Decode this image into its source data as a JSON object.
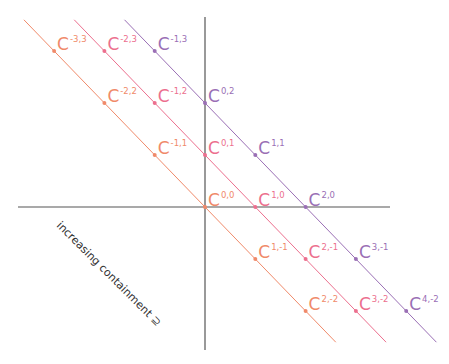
{
  "diagram": {
    "axes": {
      "origin_px": [
        205,
        207
      ],
      "horizontal": {
        "x1": 18,
        "x2": 390,
        "color": "#555555"
      },
      "vertical": {
        "y1": 17,
        "y2": 350,
        "color": "#555555"
      }
    },
    "grid_px": {
      "dx": 50.3,
      "dy": 52
    },
    "caption": {
      "text": "increasing containment ⊇",
      "x": 56,
      "y": 226,
      "rotate": 45
    },
    "lines": [
      {
        "name": "diagonal-sum-0",
        "sum": 0,
        "color": "#f08a6a"
      },
      {
        "name": "diagonal-sum-1",
        "sum": 1,
        "color": "#ec6f8e"
      },
      {
        "name": "diagonal-sum-2",
        "sum": 2,
        "color": "#9a6fb5"
      }
    ],
    "points": [
      {
        "a": -3,
        "b": 3,
        "sup": "-3,3",
        "line": 0
      },
      {
        "a": -2,
        "b": 2,
        "sup": "-2,2",
        "line": 0
      },
      {
        "a": -1,
        "b": 1,
        "sup": "-1,1",
        "line": 0
      },
      {
        "a": 0,
        "b": 0,
        "sup": "0,0",
        "line": 0
      },
      {
        "a": 1,
        "b": -1,
        "sup": "1,-1",
        "line": 0
      },
      {
        "a": 2,
        "b": -2,
        "sup": "2,-2",
        "line": 0
      },
      {
        "a": -2,
        "b": 3,
        "sup": "-2,3",
        "line": 1
      },
      {
        "a": -1,
        "b": 2,
        "sup": "-1,2",
        "line": 1
      },
      {
        "a": 0,
        "b": 1,
        "sup": "0,1",
        "line": 1
      },
      {
        "a": 1,
        "b": 0,
        "sup": "1,0",
        "line": 1
      },
      {
        "a": 2,
        "b": -1,
        "sup": "2,-1",
        "line": 1
      },
      {
        "a": 3,
        "b": -2,
        "sup": "3,-2",
        "line": 1
      },
      {
        "a": -1,
        "b": 3,
        "sup": "-1,3",
        "line": 2
      },
      {
        "a": 0,
        "b": 2,
        "sup": "0,2",
        "line": 2
      },
      {
        "a": 1,
        "b": 1,
        "sup": "1,1",
        "line": 2
      },
      {
        "a": 2,
        "b": 0,
        "sup": "2,0",
        "line": 2
      },
      {
        "a": 3,
        "b": -1,
        "sup": "3,-1",
        "line": 2
      },
      {
        "a": 4,
        "b": -2,
        "sup": "4,-2",
        "line": 2
      }
    ],
    "base_letter": "C"
  }
}
